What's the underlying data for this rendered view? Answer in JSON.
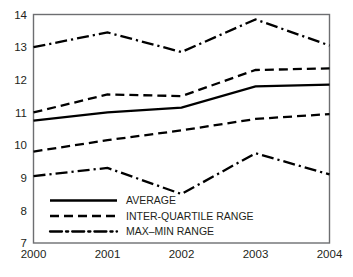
{
  "chart_data": {
    "type": "line",
    "title": "",
    "subtitle": "",
    "xlabel": "",
    "ylabel": "",
    "categories": [
      "2000",
      "2001",
      "2002",
      "2003",
      "2004"
    ],
    "x": [
      2000,
      2001,
      2002,
      2003,
      2004
    ],
    "xlim": [
      2000,
      2004
    ],
    "ylim": [
      7,
      14
    ],
    "yticks": [
      7,
      8,
      9,
      10,
      11,
      12,
      13,
      14
    ],
    "ytick_labels": [
      "7",
      "8",
      "9",
      "10",
      "11",
      "12",
      "13",
      "14"
    ],
    "xtick_labels": [
      "2000",
      "2001",
      "2002",
      "2003",
      "2004"
    ],
    "grid": false,
    "legend_position": "inside-bottom-left",
    "series": [
      {
        "name": "MAX",
        "legend_group": "MAX–MIN RANGE",
        "style": "dash-dot",
        "values": [
          13.0,
          13.45,
          12.85,
          13.85,
          13.05
        ]
      },
      {
        "name": "UPPER QUARTILE",
        "legend_group": "INTER-QUARTILE RANGE",
        "style": "dashed",
        "values": [
          11.0,
          11.55,
          11.5,
          12.3,
          12.35
        ]
      },
      {
        "name": "AVERAGE",
        "legend_group": "AVERAGE",
        "style": "solid",
        "values": [
          10.75,
          11.0,
          11.15,
          11.8,
          11.85
        ]
      },
      {
        "name": "LOWER QUARTILE",
        "legend_group": "INTER-QUARTILE RANGE",
        "style": "dashed",
        "values": [
          9.8,
          10.15,
          10.45,
          10.8,
          10.95
        ]
      },
      {
        "name": "MIN",
        "legend_group": "MAX–MIN RANGE",
        "style": "dash-dot",
        "values": [
          9.05,
          9.3,
          8.5,
          9.75,
          9.1
        ]
      }
    ],
    "legend": [
      {
        "label": "AVERAGE",
        "style": "solid"
      },
      {
        "label": "INTER-QUARTILE RANGE",
        "style": "dashed"
      },
      {
        "label": "MAX–MIN RANGE",
        "style": "dash-dot"
      }
    ],
    "colors": {
      "line": "#000000",
      "frame": "#6d6e71",
      "text": "#231f20",
      "background": "#ffffff"
    }
  }
}
